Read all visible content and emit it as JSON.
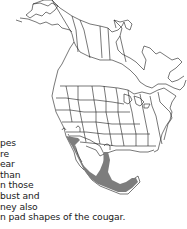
{
  "map": {
    "title": "North America range map",
    "range_color": "#7d7d7d",
    "outline_color": "#1c1c1c",
    "range_region": "Southwestern US and Mexico"
  },
  "text": {
    "lines": [
      "pes",
      "re",
      "ear",
      "than",
      "n those",
      "bust and",
      "ney also",
      "n pad shapes of the cougar."
    ]
  }
}
